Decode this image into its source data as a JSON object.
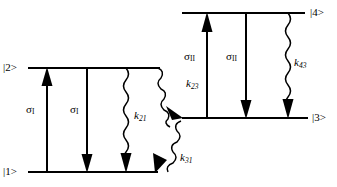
{
  "diagram": {
    "type": "energy-level-diagram",
    "title": "",
    "background_color": "#ffffff",
    "line_color": "#000000",
    "levels": [
      {
        "id": "level-2",
        "label": "|2>",
        "label_x": 3,
        "label_y": 62,
        "line_x1": 28,
        "line_x2": 160,
        "line_y": 68
      },
      {
        "id": "level-1",
        "label": "|1>",
        "label_x": 3,
        "label_y": 166,
        "line_x1": 28,
        "line_x2": 158,
        "line_y": 172
      },
      {
        "id": "level-4",
        "label": "|4>",
        "label_x": 310,
        "label_y": 7,
        "line_x1": 182,
        "line_x2": 305,
        "line_y": 13
      },
      {
        "id": "level-3",
        "label": "|3>",
        "label_x": 312,
        "label_y": 112,
        "line_x1": 182,
        "line_x2": 308,
        "line_y": 118
      }
    ],
    "transitions": [
      {
        "id": "sigma-I-absorption",
        "label": "σ",
        "sub": "I",
        "kind": "straight",
        "direction": "up",
        "x": 47,
        "y_top": 68,
        "y_bottom": 172,
        "label_x": 26,
        "label_y": 104
      },
      {
        "id": "sigma-I-emission",
        "label": "σ",
        "sub": "I",
        "kind": "straight",
        "direction": "down",
        "x": 87,
        "y_top": 68,
        "y_bottom": 172,
        "label_x": 70,
        "label_y": 104
      },
      {
        "id": "k21-nonradiative",
        "label": "k",
        "sub": "21",
        "kind": "wavy",
        "direction": "down",
        "x": 126,
        "y_top": 68,
        "y_bottom": 172,
        "label_x": 134,
        "label_y": 110
      },
      {
        "id": "k23-nonradiative",
        "label": "k",
        "sub": "23",
        "kind": "wavy-diagonal",
        "direction": "down-right",
        "x1": 158,
        "y1": 68,
        "x2": 182,
        "y2": 116,
        "label_x": 186,
        "label_y": 78
      },
      {
        "id": "k31-nonradiative",
        "label": "k",
        "sub": "31",
        "kind": "wavy-diagonal",
        "direction": "down-left",
        "x1": 181,
        "y1": 120,
        "x2": 156,
        "y2": 170,
        "label_x": 180,
        "label_y": 152
      },
      {
        "id": "sigma-II-absorption",
        "label": "σ",
        "sub": "II",
        "kind": "straight",
        "direction": "up",
        "x": 207,
        "y_top": 13,
        "y_bottom": 118,
        "label_x": 184,
        "label_y": 51
      },
      {
        "id": "sigma-II-emission",
        "label": "σ",
        "sub": "II",
        "kind": "straight",
        "direction": "down",
        "x": 246,
        "y_top": 13,
        "y_bottom": 118,
        "label_x": 226,
        "label_y": 51
      },
      {
        "id": "k43-nonradiative",
        "label": "k",
        "sub": "43",
        "kind": "wavy",
        "direction": "down",
        "x": 288,
        "y_top": 13,
        "y_bottom": 118,
        "label_x": 294,
        "label_y": 57
      }
    ]
  }
}
